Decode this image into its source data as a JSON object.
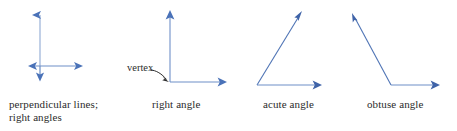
{
  "page": {
    "background_color": "#ffffff",
    "line_color": "#4a72b8",
    "text_color": "#2b2b2b",
    "width": 457,
    "height": 131
  },
  "figures": [
    {
      "id": "perpendicular-lines",
      "caption_line1": "perpendicular lines;",
      "caption_line2": "right angles",
      "type": "two-crossing-double-arrows",
      "geometry": {
        "intersection": [
          40,
          66
        ],
        "vertical": {
          "from": [
            40,
            78
          ],
          "to": [
            40,
            12
          ]
        },
        "horizontal": {
          "from": [
            28,
            66
          ],
          "to": [
            83,
            66
          ]
        },
        "arrowheads": [
          "up",
          "down",
          "left",
          "right"
        ]
      }
    },
    {
      "id": "right-angle",
      "caption_line1": "right angle",
      "caption_line2": "",
      "annotation": "vertex",
      "type": "two-rays-90-degrees",
      "geometry": {
        "vertex": [
          170,
          82
        ],
        "ray_vertical": {
          "from": [
            170,
            82
          ],
          "to": [
            170,
            10
          ]
        },
        "ray_horizontal": {
          "from": [
            170,
            82
          ],
          "to": [
            227,
            82
          ]
        },
        "pointer": {
          "from": [
            153,
            72
          ],
          "to": [
            168,
            81
          ]
        },
        "angle_degrees": 90
      }
    },
    {
      "id": "acute-angle",
      "caption_line1": "acute angle",
      "caption_line2": "",
      "type": "two-rays-acute",
      "geometry": {
        "vertex": [
          257,
          85
        ],
        "ray_diagonal": {
          "from": [
            257,
            85
          ],
          "to": [
            302,
            12
          ]
        },
        "ray_horizontal": {
          "from": [
            257,
            85
          ],
          "to": [
            322,
            85
          ]
        },
        "angle_degrees": 58
      }
    },
    {
      "id": "obtuse-angle",
      "caption_line1": "obtuse angle",
      "caption_line2": "",
      "type": "two-rays-obtuse",
      "geometry": {
        "vertex": [
          391,
          85
        ],
        "ray_diagonal": {
          "from": [
            391,
            85
          ],
          "to": [
            352,
            13
          ]
        },
        "ray_horizontal": {
          "from": [
            391,
            85
          ],
          "to": [
            440,
            85
          ]
        },
        "angle_degrees": 118
      }
    }
  ]
}
